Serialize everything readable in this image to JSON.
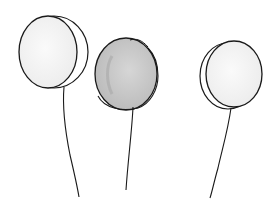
{
  "scene": {
    "description": "Hand-drawn pencil sketch of three balloons on strings",
    "background": "#ffffff",
    "stroke_color": "#1a1a1a",
    "balloons": [
      {
        "name": "left",
        "fill": "#f2f2f2",
        "shading": "light"
      },
      {
        "name": "middle",
        "fill": "#c9c9c9",
        "shading": "gray"
      },
      {
        "name": "right",
        "fill": "#f3f3f3",
        "shading": "light"
      }
    ]
  }
}
